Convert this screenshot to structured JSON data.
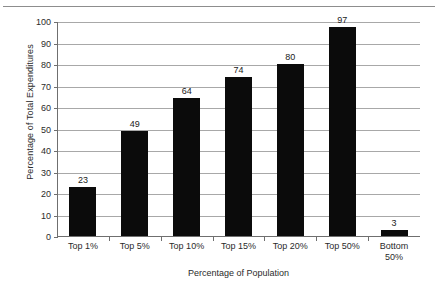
{
  "chart_data": {
    "type": "bar",
    "title": "",
    "xlabel": "Percentage of Population",
    "ylabel": "Percentage of Total Expenditures",
    "categories": [
      "Top 1%",
      "Top 5%",
      "Top 10%",
      "Top 15%",
      "Top 20%",
      "Top 50%",
      "Bottom 50%"
    ],
    "values": [
      23,
      49,
      64,
      74,
      80,
      97,
      3
    ],
    "value_labels": [
      "23",
      "49",
      "64",
      "74",
      "80",
      "97",
      "3"
    ],
    "ylim": [
      0,
      100
    ],
    "ytick_labels": [
      "0",
      "10",
      "20",
      "30",
      "40",
      "50",
      "60",
      "70",
      "80",
      "90",
      "100"
    ],
    "ytick_values": [
      0,
      10,
      20,
      30,
      40,
      50,
      60,
      70,
      80,
      90,
      100
    ],
    "grid": true,
    "legend": "none",
    "bar_color": "#0b0b0b",
    "gridline_color": "#a8a8a8",
    "axis_color": "#6f6f6f"
  }
}
